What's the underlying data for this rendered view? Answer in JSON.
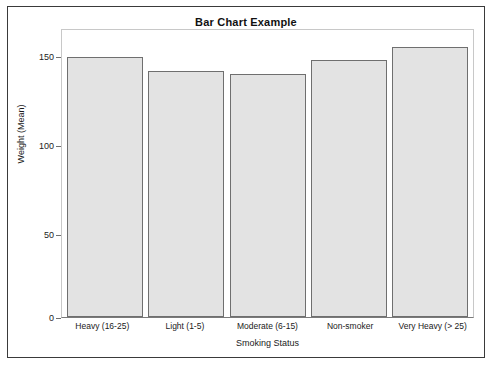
{
  "window": {
    "border_color": "#3a3a3a",
    "background": "#ffffff"
  },
  "chart_data": {
    "type": "bar",
    "title": "Bar Chart Example",
    "xlabel": "Smoking Status",
    "ylabel": "Weight (Mean)",
    "categories": [
      "Heavy (16-25)",
      "Light (1-5)",
      "Moderate (6-15)",
      "Non-smoker",
      "Very Heavy (> 25)"
    ],
    "values": [
      154,
      146,
      144,
      152,
      160
    ],
    "ylim": [
      0,
      170
    ],
    "yticks": [
      0,
      50,
      100,
      150
    ],
    "ytick_labels": [
      "0",
      "50",
      "100",
      "150"
    ],
    "grid": false,
    "legend": false,
    "bar_fill_color": "#e3e3e3",
    "bar_edge_color": "#6f6f6f"
  }
}
